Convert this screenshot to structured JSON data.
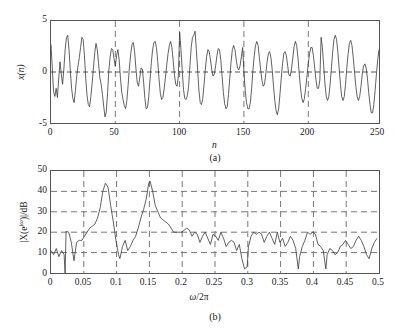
{
  "figure": {
    "panels": [
      {
        "caption": "(a)",
        "xlabel": "n",
        "ylabel": "x(n)",
        "xticks": [
          "0",
          "50",
          "100",
          "150",
          "200",
          "250"
        ],
        "yticks": [
          "5",
          "0",
          "-5"
        ]
      },
      {
        "caption": "(b)",
        "xlabel_omega": "ω",
        "xlabel_div": "/2",
        "xlabel_pi": "π",
        "ylabel_pre": "|X(e",
        "ylabel_sup": "jω",
        "ylabel_post": ")|/dB",
        "xticks": [
          "0",
          "0.05",
          "0.1",
          "0.15",
          "0.2",
          "0.25",
          "0.3",
          "0.35",
          "0.4",
          "0.45",
          "0.5"
        ],
        "yticks": [
          "50",
          "40",
          "30",
          "20",
          "10",
          "0"
        ]
      }
    ],
    "colors": {
      "trace": "#3a3a3a",
      "axis": "#555555",
      "grid": "#777777",
      "text": "#1a1a1a",
      "background": "#ffffff"
    }
  },
  "chart_data": [
    {
      "type": "line",
      "panel": "(a)",
      "title": "",
      "xlabel": "n",
      "ylabel": "x(n)",
      "xlim": [
        0,
        255
      ],
      "ylim": [
        -5,
        5
      ],
      "xticks": [
        0,
        50,
        100,
        150,
        200,
        250
      ],
      "yticks": [
        -5,
        0,
        5
      ],
      "grid": "dashed vertical at 50,100,150,200; horizontal at 0",
      "legend": "none",
      "description": "Noisy sum of two sinusoids, x(n), 256 samples, amplitude swings between about -4.6 and +4.4",
      "x": [
        0,
        1,
        2,
        3,
        4,
        5,
        6,
        7,
        8,
        9,
        10,
        11,
        12,
        13,
        14,
        15,
        16,
        17,
        18,
        19,
        20,
        21,
        22,
        23,
        24,
        25,
        26,
        27,
        28,
        29,
        30,
        31,
        32,
        33,
        34,
        35,
        36,
        37,
        38,
        39,
        40,
        41,
        42,
        43,
        44,
        45,
        46,
        47,
        48,
        49,
        50,
        51,
        52,
        53,
        54,
        55,
        56,
        57,
        58,
        59,
        60,
        61,
        62,
        63,
        64,
        65,
        66,
        67,
        68,
        69,
        70,
        71,
        72,
        73,
        74,
        75,
        76,
        77,
        78,
        79,
        80,
        81,
        82,
        83,
        84,
        85,
        86,
        87,
        88,
        89,
        90,
        91,
        92,
        93,
        94,
        95,
        96,
        97,
        98,
        99,
        100,
        101,
        102,
        103,
        104,
        105,
        106,
        107,
        108,
        109,
        110,
        111,
        112,
        113,
        114,
        115,
        116,
        117,
        118,
        119,
        120,
        121,
        122,
        123,
        124,
        125,
        126,
        127,
        128,
        129,
        130,
        131,
        132,
        133,
        134,
        135,
        136,
        137,
        138,
        139,
        140,
        141,
        142,
        143,
        144,
        145,
        146,
        147,
        148,
        149,
        150,
        151,
        152,
        153,
        154,
        155,
        156,
        157,
        158,
        159,
        160,
        161,
        162,
        163,
        164,
        165,
        166,
        167,
        168,
        169,
        170,
        171,
        172,
        173,
        174,
        175,
        176,
        177,
        178,
        179,
        180,
        181,
        182,
        183,
        184,
        185,
        186,
        187,
        188,
        189,
        190,
        191,
        192,
        193,
        194,
        195,
        196,
        197,
        198,
        199,
        200,
        201,
        202,
        203,
        204,
        205,
        206,
        207,
        208,
        209,
        210,
        211,
        212,
        213,
        214,
        215,
        216,
        217,
        218,
        219,
        220,
        221,
        222,
        223,
        224,
        225,
        226,
        227,
        228,
        229,
        230,
        231,
        232,
        233,
        234,
        235,
        236,
        237,
        238,
        239,
        240,
        241,
        242,
        243,
        244,
        245,
        246,
        247,
        248,
        249,
        250,
        251,
        252,
        253,
        254,
        255
      ],
      "values": [
        2.7,
        0.4,
        -1.9,
        -2.4,
        -1.6,
        -2.5,
        -0.6,
        1.0,
        -0.2,
        -1.2,
        0.3,
        2.2,
        3.4,
        3.6,
        2.2,
        0.2,
        -1.6,
        -2.6,
        -3.0,
        -1.8,
        -0.4,
        0.6,
        1.4,
        2.4,
        3.4,
        3.2,
        1.6,
        -0.6,
        -2.3,
        -3.2,
        -3.4,
        -2.4,
        -1.1,
        0.4,
        1.9,
        2.8,
        2.2,
        0.8,
        -0.6,
        -1.2,
        -2.2,
        -3.4,
        -4.4,
        -3.9,
        -2.0,
        0.2,
        1.5,
        2.3,
        2.2,
        1.3,
        0.6,
        1.6,
        2.2,
        1.2,
        -0.6,
        -2.0,
        -2.7,
        -3.3,
        -3.6,
        -2.8,
        -1.2,
        0.5,
        1.8,
        2.7,
        2.9,
        2.0,
        0.4,
        -1.0,
        -1.4,
        -0.6,
        0.4,
        0.3,
        -1.0,
        -2.6,
        -3.6,
        -3.5,
        -2.4,
        -0.7,
        0.9,
        2.2,
        2.9,
        3.0,
        2.4,
        1.0,
        -0.7,
        -2.1,
        -2.7,
        -2.5,
        -1.6,
        -0.5,
        0.7,
        1.8,
        2.6,
        3.0,
        2.4,
        1.1,
        -0.3,
        -1.2,
        -1.4,
        -0.4,
        3.9,
        2.3,
        0.2,
        -1.7,
        -2.6,
        -2.7,
        -2.3,
        -1.4,
        0.6,
        2.4,
        3.4,
        3.6,
        4.0,
        2.2,
        0.2,
        -1.8,
        -3.0,
        -3.2,
        -2.6,
        -1.2,
        0.3,
        1.5,
        2.2,
        2.0,
        1.2,
        0.2,
        -0.4,
        -0.2,
        0.6,
        1.6,
        2.3,
        2.2,
        1.2,
        -0.4,
        -2.0,
        -3.1,
        -3.6,
        -3.4,
        -2.2,
        -0.6,
        1.0,
        2.2,
        2.6,
        2.2,
        1.2,
        0.4,
        0.2,
        0.6,
        1.5,
        2.4,
        0.0,
        -1.8,
        -3.0,
        -3.6,
        -3.6,
        -3.0,
        -1.6,
        0.2,
        1.6,
        2.6,
        3.0,
        2.6,
        1.4,
        0.2,
        -0.8,
        -1.4,
        -1.2,
        -0.2,
        1.0,
        1.8,
        2.0,
        1.4,
        0.2,
        -1.4,
        -2.8,
        -3.8,
        -4.2,
        -3.6,
        -2.2,
        -0.6,
        0.8,
        1.8,
        2.0,
        1.6,
        0.6,
        -0.3,
        -0.4,
        0.3,
        1.4,
        2.5,
        3.0,
        2.6,
        1.4,
        -0.2,
        -1.6,
        -2.6,
        -3.0,
        -2.6,
        -1.6,
        -0.4,
        0.8,
        1.8,
        2.4,
        2.4,
        1.6,
        0.4,
        -0.8,
        -1.6,
        -1.6,
        -0.8,
        3.4,
        2.4,
        0.6,
        -1.2,
        -2.4,
        -2.8,
        -2.4,
        -1.2,
        0.4,
        2.0,
        3.2,
        3.6,
        3.2,
        2.0,
        0.4,
        -1.2,
        -2.4,
        -2.8,
        -2.4,
        -1.2,
        0.4,
        1.8,
        2.8,
        3.1,
        2.6,
        1.4,
        0.0,
        -1.4,
        -2.4,
        -2.8,
        -2.4,
        -1.4,
        -0.2,
        0.6,
        0.8,
        0.4,
        -0.6,
        -2.0,
        -3.2,
        -4.0,
        -4.0,
        -3.2,
        -1.8,
        -0.2,
        1.2,
        2.2,
        2.6,
        2.2,
        1.2,
        0.2,
        -0.8,
        -1.4,
        -1.2,
        -0.4,
        0.0
      ]
    },
    {
      "type": "line",
      "panel": "(b)",
      "title": "",
      "xlabel": "ω/2π",
      "ylabel": "|X(e^jω)|/dB",
      "xlim": [
        0,
        0.5
      ],
      "ylim": [
        0,
        50
      ],
      "xticks": [
        0,
        0.05,
        0.1,
        0.15,
        0.2,
        0.25,
        0.3,
        0.35,
        0.4,
        0.45,
        0.5
      ],
      "yticks": [
        0,
        10,
        20,
        30,
        40,
        50
      ],
      "grid": "dashed both axes",
      "legend": "none",
      "description": "Magnitude spectrum in dB showing a broad peak near 0.08 at about 44 dB and a sharp peak near 0.15 at about 45 dB, with a noise floor between about 5 and 20 dB above 0.2",
      "peaks": [
        {
          "x": 0.08,
          "y": 44
        },
        {
          "x": 0.15,
          "y": 45
        }
      ],
      "x": [
        0,
        0.004,
        0.008,
        0.012,
        0.016,
        0.02,
        0.0215,
        0.023,
        0.027,
        0.031,
        0.035,
        0.039,
        0.043,
        0.047,
        0.051,
        0.055,
        0.059,
        0.063,
        0.067,
        0.071,
        0.075,
        0.079,
        0.083,
        0.087,
        0.091,
        0.095,
        0.099,
        0.103,
        0.105,
        0.109,
        0.113,
        0.117,
        0.121,
        0.125,
        0.129,
        0.133,
        0.137,
        0.141,
        0.145,
        0.149,
        0.151,
        0.155,
        0.159,
        0.163,
        0.167,
        0.171,
        0.175,
        0.179,
        0.183,
        0.187,
        0.191,
        0.195,
        0.199,
        0.203,
        0.207,
        0.211,
        0.215,
        0.219,
        0.223,
        0.227,
        0.231,
        0.235,
        0.239,
        0.243,
        0.247,
        0.251,
        0.255,
        0.259,
        0.263,
        0.267,
        0.271,
        0.275,
        0.279,
        0.283,
        0.287,
        0.291,
        0.295,
        0.299,
        0.301,
        0.305,
        0.309,
        0.313,
        0.317,
        0.321,
        0.325,
        0.329,
        0.333,
        0.337,
        0.341,
        0.345,
        0.349,
        0.353,
        0.357,
        0.361,
        0.365,
        0.369,
        0.373,
        0.377,
        0.379,
        0.383,
        0.387,
        0.391,
        0.395,
        0.399,
        0.403,
        0.407,
        0.411,
        0.415,
        0.419,
        0.421,
        0.425,
        0.429,
        0.433,
        0.437,
        0.441,
        0.445,
        0.449,
        0.453,
        0.457,
        0.461,
        0.465,
        0.469,
        0.473,
        0.477,
        0.481,
        0.485,
        0.489,
        0.493,
        0.497,
        0.5
      ],
      "values": [
        11,
        9,
        12,
        8,
        11,
        9,
        0,
        20.5,
        20,
        15,
        6,
        15,
        16,
        16,
        18,
        20,
        22,
        23,
        24,
        27,
        32,
        40,
        44,
        42,
        33,
        25,
        16,
        9,
        7,
        13,
        16,
        11,
        13,
        16,
        18,
        22,
        27,
        31,
        36,
        44,
        45,
        40,
        33,
        30,
        27,
        26,
        25,
        24,
        22,
        20,
        20,
        20,
        20,
        21,
        22,
        21,
        18,
        20,
        19,
        15,
        18,
        20,
        17,
        14,
        19,
        18,
        16,
        20,
        17,
        13,
        15,
        16,
        15,
        11,
        14,
        7,
        2,
        3,
        13,
        18,
        20,
        19,
        20,
        19,
        15,
        18,
        20,
        17,
        14,
        20,
        15,
        17,
        13,
        15,
        18,
        16,
        12,
        2,
        8,
        13,
        16,
        20,
        19,
        20,
        19,
        14,
        13,
        11,
        2,
        9,
        12,
        11,
        9,
        10,
        13,
        14,
        16,
        14,
        12,
        13,
        16,
        18,
        16,
        13,
        9,
        7,
        12,
        15,
        17
      ]
    }
  ]
}
